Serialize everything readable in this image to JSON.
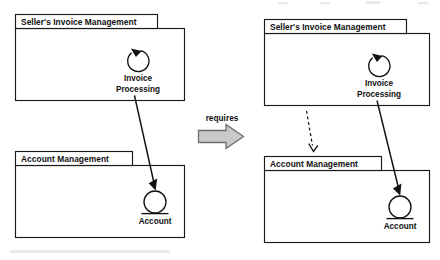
{
  "diagram": {
    "type": "uml-package-diagram",
    "title": "",
    "background_color": "#ffffff",
    "line_color": "#111111",
    "transform_label": "requires",
    "transform_arrow_color": "#c9c9c9",
    "transform_arrow_border_color": "#6e6e6e",
    "panels": [
      {
        "id": "before",
        "side": "left",
        "packages": [
          {
            "id": "left-seller-invoice-management",
            "name": "Seller's Invoice Management",
            "element": {
              "id": "left-invoice-processing",
              "name": "Invoice Processing",
              "label_lines": [
                "Invoice",
                "Processing"
              ],
              "symbol": "circular-arrow"
            }
          },
          {
            "id": "left-account-management",
            "name": "Account Management",
            "element": {
              "id": "left-account",
              "name": "Account",
              "label_lines": [
                "Account"
              ],
              "symbol": "circle-underline"
            }
          }
        ],
        "connections": [
          {
            "id": "left-uses",
            "from": "left-invoice-processing",
            "to": "left-account",
            "style": "solid",
            "arrowhead": "filled",
            "label": ""
          }
        ]
      },
      {
        "id": "after",
        "side": "right",
        "packages": [
          {
            "id": "right-seller-invoice-management",
            "name": "Seller's Invoice Management",
            "element": {
              "id": "right-invoice-processing",
              "name": "Invoice Processing",
              "label_lines": [
                "Invoice",
                "Processing"
              ],
              "symbol": "circular-arrow"
            }
          },
          {
            "id": "right-account-management",
            "name": "Account Management",
            "element": {
              "id": "right-account",
              "name": "Account",
              "label_lines": [
                "Account"
              ],
              "symbol": "circle-underline"
            }
          }
        ],
        "connections": [
          {
            "id": "right-dependency",
            "from": "right-seller-invoice-management",
            "to": "right-account-management",
            "style": "dashed",
            "arrowhead": "open",
            "label": ""
          },
          {
            "id": "right-uses",
            "from": "right-invoice-processing",
            "to": "right-account",
            "style": "solid",
            "arrowhead": "filled",
            "label": ""
          }
        ]
      }
    ]
  }
}
